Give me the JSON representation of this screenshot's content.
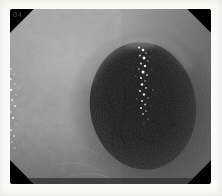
{
  "photo": {
    "kind": "grayscale endoscopy photograph",
    "description": "Endoscopic view looking into a dark colonic lumen opening at center-right, surrounded by finely textured gray mucosal walls. A vertical streak of bright specular reflections runs down inside the lumen; small bright specks line the left edge. The endoscope frame is an octagon with black cut corners, set on a white border.",
    "corner_label": "04",
    "colors": {
      "page_background": "#fbfbf9",
      "frame_black": "#000000",
      "mucosa_light": "#a9a9a9",
      "mucosa_mid": "#8c8c8c",
      "mucosa_dark": "#646464",
      "lumen_core": "#151515",
      "lumen_edge": "#3a3a3a",
      "specular_highlight": "#ffffff",
      "label_gray": "#4f4f4f"
    },
    "lumen_sparkles": [
      [
        139,
        47.5,
        1.1,
        0.9
      ],
      [
        143,
        50,
        1.3,
        1
      ],
      [
        146,
        53,
        0.8,
        0.7
      ],
      [
        140,
        55.5,
        0.9,
        0.85
      ],
      [
        144,
        58,
        1.4,
        1
      ],
      [
        148,
        61,
        0.8,
        0.6
      ],
      [
        141,
        63.5,
        1,
        0.9
      ],
      [
        145,
        66,
        1.2,
        0.95
      ],
      [
        139,
        69,
        0.8,
        0.7
      ],
      [
        143,
        72,
        1.5,
        1
      ],
      [
        147,
        75,
        0.9,
        0.75
      ],
      [
        141,
        78,
        1.1,
        0.9
      ],
      [
        145,
        81,
        0.8,
        0.7
      ],
      [
        142,
        84.5,
        1.3,
        0.95
      ],
      [
        146,
        88,
        0.9,
        0.75
      ],
      [
        140,
        91,
        1,
        0.85
      ],
      [
        144,
        94.5,
        1.2,
        0.9
      ],
      [
        148,
        98,
        0.7,
        0.6
      ],
      [
        142,
        101,
        1,
        0.85
      ],
      [
        145,
        104.5,
        0.9,
        0.75
      ],
      [
        141,
        108,
        1.1,
        0.85
      ],
      [
        146,
        111,
        0.8,
        0.65
      ],
      [
        143,
        114,
        0.9,
        0.7
      ],
      [
        150,
        57,
        0.6,
        0.5
      ],
      [
        152,
        70,
        0.6,
        0.45
      ],
      [
        136,
        76,
        0.6,
        0.5
      ],
      [
        153,
        90,
        0.7,
        0.5
      ],
      [
        137,
        99,
        0.6,
        0.45
      ],
      [
        151,
        106,
        0.6,
        0.4
      ],
      [
        148,
        119,
        0.7,
        0.5
      ],
      [
        144,
        123,
        0.6,
        0.4
      ]
    ],
    "edge_sparkles": [
      [
        11,
        69,
        0.9,
        0.8
      ],
      [
        14,
        74,
        0.7,
        0.6
      ],
      [
        10.5,
        79,
        1.1,
        0.9
      ],
      [
        15,
        84,
        0.8,
        0.65
      ],
      [
        11,
        90,
        1.2,
        0.95
      ],
      [
        16,
        95,
        0.7,
        0.55
      ],
      [
        12,
        100,
        1,
        0.85
      ],
      [
        15,
        106,
        1,
        0.8
      ],
      [
        10.5,
        112,
        0.9,
        0.7
      ],
      [
        13,
        118,
        1.1,
        0.85
      ],
      [
        16,
        124,
        0.7,
        0.55
      ],
      [
        11,
        130,
        1,
        0.8
      ],
      [
        14,
        136,
        0.9,
        0.7
      ],
      [
        12,
        142,
        0.8,
        0.6
      ],
      [
        15,
        148,
        0.7,
        0.55
      ],
      [
        19,
        88,
        0.6,
        0.45
      ],
      [
        20,
        110,
        0.6,
        0.4
      ],
      [
        18,
        132,
        0.6,
        0.4
      ],
      [
        21,
        77,
        0.5,
        0.35
      ],
      [
        19,
        146,
        0.5,
        0.35
      ]
    ]
  }
}
